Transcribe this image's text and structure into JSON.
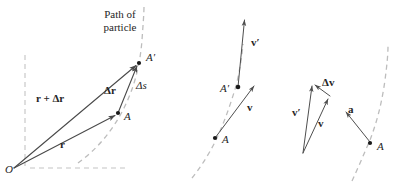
{
  "figure": {
    "title_caption": "Path of particle",
    "colors": {
      "line": "#4a4a4a",
      "dashed_path": "#bdbdbd",
      "dashed_axis": "#c4c4c4",
      "point": "#1a1a1a",
      "text": "#262626",
      "background": "#ffffff"
    }
  },
  "panels": [
    {
      "id": "position-panel",
      "name": "position-vector-panel",
      "path_label_line1": "Path of",
      "path_label_line2": "particle",
      "labels": {
        "origin": "O",
        "point_a": "A",
        "point_a_prime": "A′",
        "vector_r": "r",
        "vector_r_plus_dr": "r + Δr",
        "vector_delta_r": "Δr",
        "arc_length_delta_s": "Δs"
      },
      "points": {
        "origin": [
          14,
          168
        ],
        "a": [
          118,
          113
        ],
        "a_prime": [
          139,
          63
        ]
      },
      "vectors": [
        {
          "name": "r",
          "from": [
            14,
            168
          ],
          "to": [
            118,
            113
          ],
          "style": "bold"
        },
        {
          "name": "r + Δr",
          "from": [
            14,
            168
          ],
          "to": [
            139,
            63
          ],
          "style": "bold"
        },
        {
          "name": "Δr",
          "from": [
            118,
            113
          ],
          "to": [
            139,
            63
          ],
          "style": "bold"
        }
      ]
    },
    {
      "id": "velocity-panel",
      "name": "velocity-vector-panel",
      "labels": {
        "point_a": "A",
        "point_a_prime": "A′",
        "vector_v": "v",
        "vector_v_prime": "v′"
      },
      "points": {
        "a": [
          215,
          138
        ],
        "a_prime": [
          238,
          87
        ]
      },
      "vectors": [
        {
          "name": "v",
          "from": [
            215,
            138
          ],
          "to": [
            256,
            84
          ],
          "style": "bold"
        },
        {
          "name": "v′",
          "from": [
            238,
            87
          ],
          "to": [
            245,
            17
          ],
          "style": "bold"
        }
      ]
    },
    {
      "id": "acceleration-panel",
      "name": "acceleration-vector-panel",
      "labels": {
        "point_a": "A",
        "vector_v": "v",
        "vector_v_prime": "v′",
        "vector_delta_v": "Δv",
        "vector_a": "a"
      },
      "points": {
        "a": [
          370,
          143
        ]
      },
      "vectors": [
        {
          "name": "v′",
          "from": [
            303,
            153
          ],
          "to": [
            313,
            83
          ],
          "style": "bold"
        },
        {
          "name": "v",
          "from": [
            303,
            153
          ],
          "to": [
            330,
            96
          ],
          "style": "bold"
        },
        {
          "name": "Δv",
          "from": [
            330,
            96
          ],
          "to": [
            313,
            83
          ],
          "style": "bold"
        },
        {
          "name": "a",
          "from": [
            370,
            143
          ],
          "to": [
            345,
            111
          ],
          "style": "bold"
        }
      ]
    }
  ]
}
